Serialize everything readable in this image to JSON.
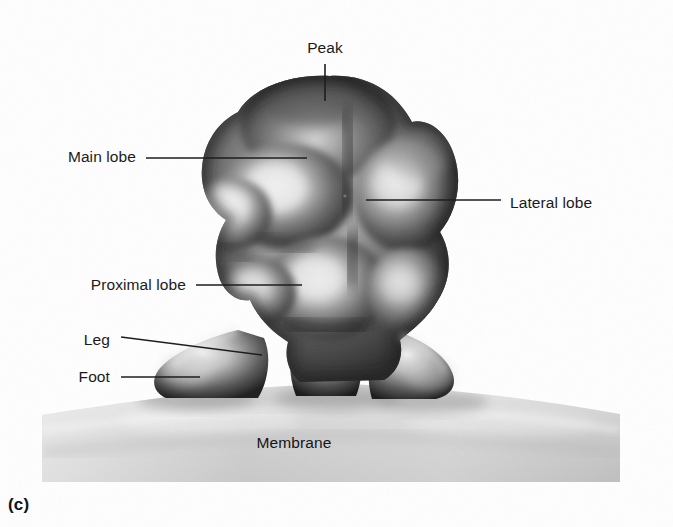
{
  "figure": {
    "caption": "(c)",
    "background_color": "#ffffff",
    "ink_color": "#1b1b1b",
    "membrane_color": "#c9c9c9",
    "particle_dark": "#3a3a3a",
    "particle_light": "#e8e8e8"
  },
  "labels": [
    {
      "id": "peak",
      "text": "Peak",
      "text_x": 325,
      "text_y": 48,
      "align": "center",
      "leader": {
        "x1": 325,
        "y1": 64,
        "x2": 325,
        "y2": 101
      }
    },
    {
      "id": "main-lobe",
      "text": "Main lobe",
      "text_x": 136,
      "text_y": 157,
      "align": "right",
      "leader": {
        "x1": 146,
        "y1": 158,
        "x2": 307,
        "y2": 158
      }
    },
    {
      "id": "lateral-lobe",
      "text": "Lateral lobe",
      "text_x": 510,
      "text_y": 203,
      "align": "left",
      "leader": {
        "x1": 366,
        "y1": 200,
        "x2": 501,
        "y2": 200
      }
    },
    {
      "id": "proximal-lobe",
      "text": "Proximal lobe",
      "text_x": 186,
      "text_y": 285,
      "align": "right",
      "leader": {
        "x1": 196,
        "y1": 285,
        "x2": 302,
        "y2": 285
      }
    },
    {
      "id": "leg",
      "text": "Leg",
      "text_x": 110,
      "text_y": 340,
      "align": "right",
      "leader": {
        "x1": 121,
        "y1": 337,
        "x2": 262,
        "y2": 355
      }
    },
    {
      "id": "foot",
      "text": "Foot",
      "text_x": 110,
      "text_y": 377,
      "align": "right",
      "leader": {
        "x1": 121,
        "y1": 377,
        "x2": 200,
        "y2": 377
      }
    },
    {
      "id": "membrane",
      "text": "Membrane",
      "text_x": 294,
      "text_y": 443,
      "align": "center",
      "leader": null
    }
  ]
}
